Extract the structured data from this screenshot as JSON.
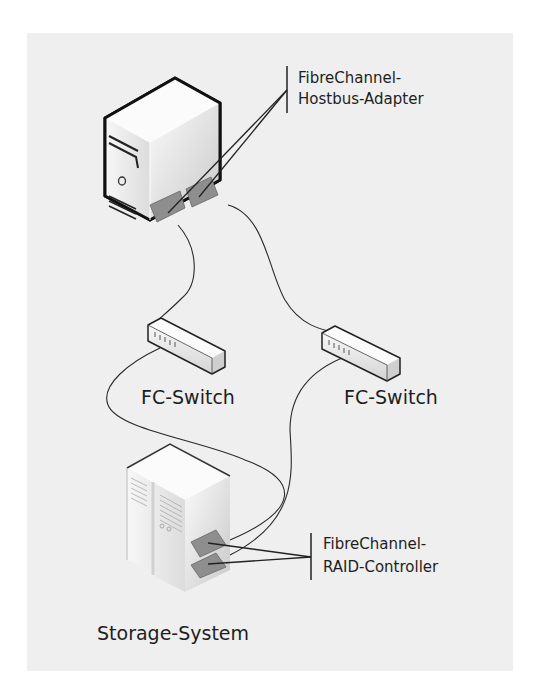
{
  "diagram": {
    "labels": {
      "hba_line1": "FibreChannel-",
      "hba_line2": "Hostbus-Adapter",
      "switch_left": "FC-Switch",
      "switch_right": "FC-Switch",
      "raid_line1": "FibreChannel-",
      "raid_line2": "RAID-Controller",
      "storage": "Storage-System"
    },
    "nodes": [
      {
        "id": "server",
        "type": "server-tower",
        "ports": [
          "hba-1",
          "hba-2"
        ]
      },
      {
        "id": "switch-left",
        "type": "fc-switch"
      },
      {
        "id": "switch-right",
        "type": "fc-switch"
      },
      {
        "id": "storage",
        "type": "storage-system",
        "ports": [
          "raid-1",
          "raid-2"
        ]
      }
    ],
    "edges": [
      {
        "from": "hba-1",
        "to": "switch-left"
      },
      {
        "from": "hba-2",
        "to": "switch-right"
      },
      {
        "from": "switch-left",
        "to": "raid-1"
      },
      {
        "from": "switch-right",
        "to": "raid-2"
      }
    ],
    "colors": {
      "panel": "#efefef",
      "stroke": "#1e1e1e",
      "port": "#8e8e8e"
    }
  }
}
